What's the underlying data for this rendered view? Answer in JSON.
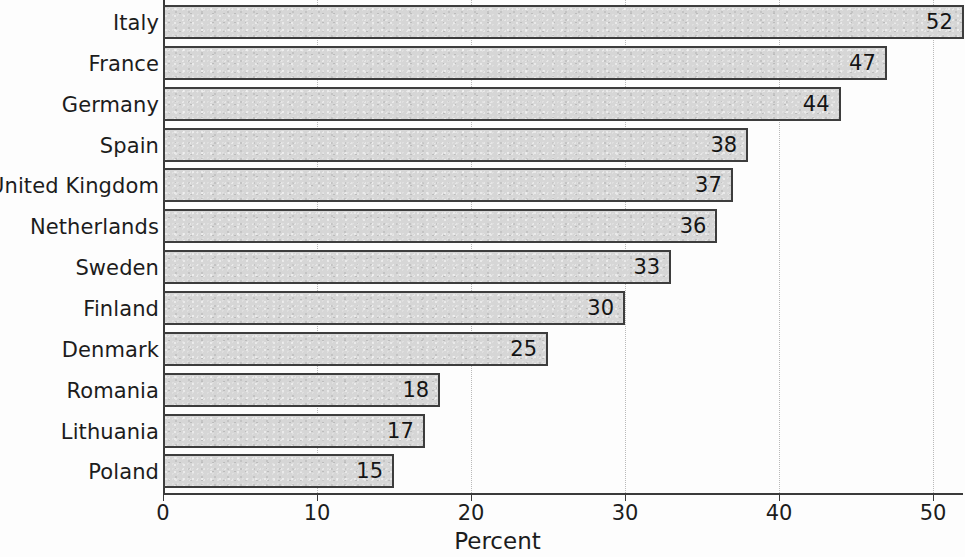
{
  "chart_data": {
    "type": "bar",
    "orientation": "horizontal",
    "title": "",
    "xlabel": "Percent",
    "ylabel": "",
    "categories": [
      "Italy",
      "France",
      "Germany",
      "Spain",
      "United Kingdom",
      "Netherlands",
      "Sweden",
      "Finland",
      "Denmark",
      "Romania",
      "Lithuania",
      "Poland"
    ],
    "values": [
      52,
      47,
      44,
      38,
      37,
      36,
      33,
      30,
      25,
      18,
      17,
      15
    ],
    "value_labels": [
      "52",
      "47",
      "44",
      "38",
      "37",
      "36",
      "33",
      "30",
      "25",
      "18",
      "17",
      "15"
    ],
    "xlim": [
      0,
      52
    ],
    "x_ticks": [
      0,
      10,
      20,
      30,
      40,
      50
    ],
    "x_tick_labels": [
      "0",
      "10",
      "20",
      "30",
      "40",
      "50"
    ],
    "grid": {
      "vertical": true,
      "horizontal": false,
      "style": "dotted",
      "color": "#b9b9b9"
    },
    "legend": {
      "visible": false,
      "position": "none",
      "entries": []
    },
    "colors": {
      "bar_fill": "#d6d6d6",
      "bar_border": "#3d3d3d",
      "axis": "#3a3a3a",
      "text": "#1c1c1c",
      "background": "#fdfdfd"
    }
  }
}
